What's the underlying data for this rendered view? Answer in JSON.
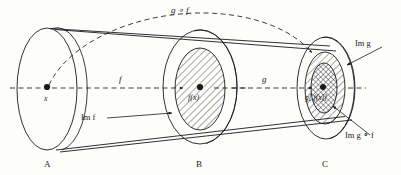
{
  "figure": {
    "type": "function-composition-diagram",
    "background_color": "#fdfdfc",
    "ink_color": "#1a1a1a"
  },
  "sets": {
    "a": {
      "label": "A",
      "center_point_label": "x"
    },
    "b": {
      "label": "B",
      "image_point_label": "f(x)",
      "region_label": "Im f"
    },
    "c": {
      "label": "C",
      "image_point_label": "g[ f(x)]",
      "region_label_outer": "Im g",
      "region_label_inner": "Im g ∘ f"
    }
  },
  "maps": {
    "f": "f",
    "g": "g",
    "composite": "g ∘ f"
  },
  "geometry": {
    "ellipse_a": {
      "cx": 47,
      "cy": 89,
      "rx": 30,
      "ry": 61
    },
    "ellipse_b_outer": {
      "cx": 200,
      "cy": 87,
      "rx": 37,
      "ry": 57
    },
    "ellipse_b_inner": {
      "cx": 200,
      "cy": 89,
      "rx": 25,
      "ry": 41
    },
    "ellipse_c_outer": {
      "cx": 326,
      "cy": 88,
      "rx": 29,
      "ry": 51
    },
    "ellipse_c_mid": {
      "cx": 325,
      "cy": 88,
      "rx": 20,
      "ry": 36
    },
    "ellipse_c_inner": {
      "cx": 324,
      "cy": 88,
      "rx": 13,
      "ry": 25
    }
  }
}
